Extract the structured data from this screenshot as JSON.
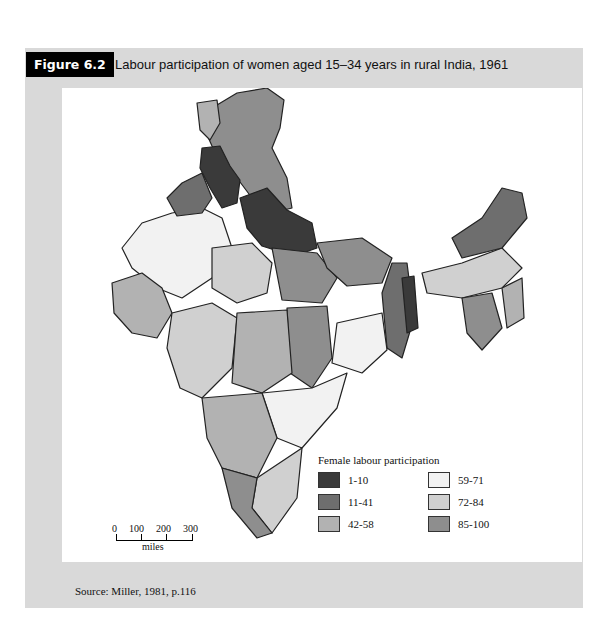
{
  "figure": {
    "label": "Figure 6.2",
    "title": "Labour participation of women aged 15–34 years in rural India, 1961"
  },
  "legend": {
    "title": "Female labour participation",
    "items": [
      {
        "range": "1-10",
        "color": "#3a3a3a"
      },
      {
        "range": "59-71",
        "color": "#f2f2f2"
      },
      {
        "range": "11-41",
        "color": "#6e6e6e"
      },
      {
        "range": "72-84",
        "color": "#d0d0d0"
      },
      {
        "range": "42-58",
        "color": "#b2b2b2"
      },
      {
        "range": "85-100",
        "color": "#8e8e8e"
      }
    ]
  },
  "scale": {
    "ticks": [
      "0",
      "100",
      "200",
      "300"
    ],
    "unit": "miles"
  },
  "source": "Source: Miller, 1981, p.116"
}
